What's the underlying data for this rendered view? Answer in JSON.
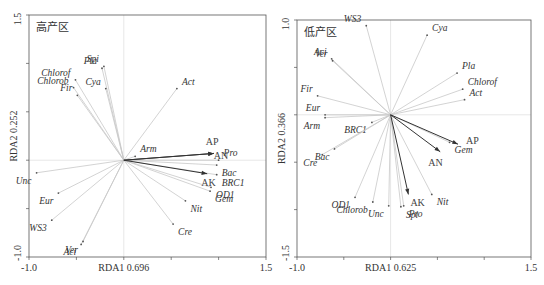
{
  "chart_data": [
    {
      "type": "scatter",
      "subtype": "rda-biplot",
      "title": "高产区",
      "xlabel": "RDA1 0.696",
      "ylabel": "RDA2 0.252",
      "xlim": [
        -1.0,
        1.5
      ],
      "ylim": [
        -1.0,
        1.5
      ],
      "x_ticks": [
        "-1.0",
        "1.5"
      ],
      "y_ticks": [
        "1.5",
        "-1.0"
      ],
      "environmental_vectors": [
        {
          "name": "AP",
          "x": 0.95,
          "y": 0.07
        },
        {
          "name": "AN",
          "x": 0.95,
          "y": 0.07
        },
        {
          "name": "AK",
          "x": 0.88,
          "y": -0.14
        }
      ],
      "species": [
        {
          "name": "Pla",
          "x": -0.23,
          "y": 0.95
        },
        {
          "name": "Spi",
          "x": -0.21,
          "y": 0.97
        },
        {
          "name": "Cya",
          "x": -0.19,
          "y": 0.74
        },
        {
          "name": "Chlorof",
          "x": -0.51,
          "y": 0.83
        },
        {
          "name": "Chlorob",
          "x": -0.53,
          "y": 0.75
        },
        {
          "name": "Fir",
          "x": -0.49,
          "y": 0.67
        },
        {
          "name": "Act",
          "x": 0.56,
          "y": 0.74
        },
        {
          "name": "Arm",
          "x": 0.12,
          "y": 0.04
        },
        {
          "name": "Pro",
          "x": 1.0,
          "y": 0.0
        },
        {
          "name": "Bac",
          "x": 0.98,
          "y": -0.05
        },
        {
          "name": "BRC1",
          "x": 0.98,
          "y": -0.15
        },
        {
          "name": "OD1",
          "x": 0.92,
          "y": -0.28
        },
        {
          "name": "Gem",
          "x": 0.91,
          "y": -0.32
        },
        {
          "name": "Nit",
          "x": 0.65,
          "y": -0.42
        },
        {
          "name": "Cre",
          "x": 0.52,
          "y": -0.66
        },
        {
          "name": "Unc",
          "x": -0.92,
          "y": -0.13
        },
        {
          "name": "Eur",
          "x": -0.69,
          "y": -0.34
        },
        {
          "name": "WS3",
          "x": -0.76,
          "y": -0.62
        },
        {
          "name": "Aci",
          "x": -0.45,
          "y": -0.87
        },
        {
          "name": "Ver",
          "x": -0.43,
          "y": -0.84
        }
      ]
    },
    {
      "type": "scatter",
      "subtype": "rda-biplot",
      "title": "低产区",
      "xlabel": "RDA1 0.625",
      "ylabel": "RDA2 0.366",
      "xlim": [
        -1.0,
        1.5
      ],
      "ylim": [
        -1.5,
        1.0
      ],
      "x_ticks": [
        "-1.0",
        "1.5"
      ],
      "y_ticks": [
        "1.0",
        "-1.5"
      ],
      "environmental_vectors": [
        {
          "name": "AP",
          "x": 0.72,
          "y": -0.31
        },
        {
          "name": "AN",
          "x": 0.53,
          "y": -0.39
        },
        {
          "name": "AK",
          "x": 0.19,
          "y": -0.84
        }
      ],
      "species": [
        {
          "name": "WS3",
          "x": -0.26,
          "y": 0.94
        },
        {
          "name": "Cya",
          "x": 0.39,
          "y": 0.84
        },
        {
          "name": "Aci",
          "x": -0.63,
          "y": 0.59
        },
        {
          "name": "Ver",
          "x": -0.62,
          "y": 0.57
        },
        {
          "name": "Pla",
          "x": 0.71,
          "y": 0.44
        },
        {
          "name": "Chlorof",
          "x": 0.77,
          "y": 0.27
        },
        {
          "name": "Act",
          "x": 0.79,
          "y": 0.16
        },
        {
          "name": "Fir",
          "x": -0.78,
          "y": 0.2
        },
        {
          "name": "Eur",
          "x": -0.7,
          "y": 0.0
        },
        {
          "name": "Arm",
          "x": -0.7,
          "y": -0.03
        },
        {
          "name": "BRC1",
          "x": -0.2,
          "y": -0.08
        },
        {
          "name": "Bac",
          "x": -0.6,
          "y": -0.36
        },
        {
          "name": "Cre",
          "x": -0.73,
          "y": -0.42
        },
        {
          "name": "Gem",
          "x": 0.63,
          "y": -0.29
        },
        {
          "name": "Nit",
          "x": 0.44,
          "y": -0.84
        },
        {
          "name": "OD1",
          "x": -0.38,
          "y": -0.87
        },
        {
          "name": "Unc",
          "x": -0.02,
          "y": -0.96
        },
        {
          "name": "Chlorob",
          "x": -0.19,
          "y": -0.92
        },
        {
          "name": "Pro",
          "x": 0.14,
          "y": -0.96
        },
        {
          "name": "Spi",
          "x": 0.11,
          "y": -0.97
        }
      ]
    }
  ]
}
